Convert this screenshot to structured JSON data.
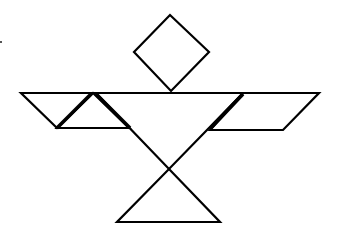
{
  "figure": {
    "type": "tangram",
    "stroke_color": "#000000",
    "background": "#ffffff",
    "pieces": {
      "head_square": {
        "points": "170,15 209,52 171,91 134,52"
      },
      "left_parallelogram": {
        "points": "21,93 93,93 57,128"
      },
      "left_small_triangle": {
        "points": "93,93 129,128 57,128"
      },
      "center_large_triangle": {
        "points": "96,93 243,93 169,169"
      },
      "right_parallelogram": {
        "points": "243,93 319,93 283,130 210,130"
      },
      "bottom_triangle": {
        "points": "169,169 220,222 117,222"
      }
    },
    "top_line": {
      "x1": 21,
      "y1": 93,
      "x2": 319,
      "y2": 93
    }
  }
}
